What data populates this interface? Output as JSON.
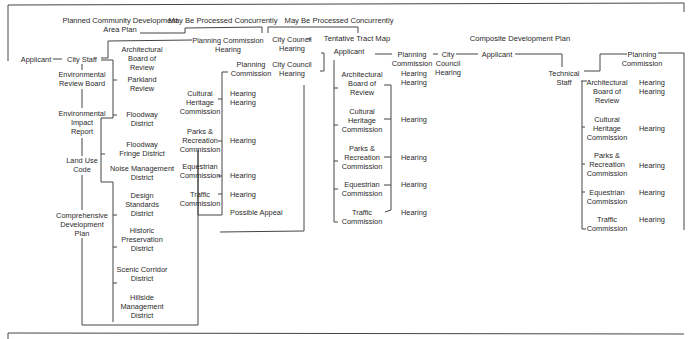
{
  "headers": {
    "pcd_area_plan": "Planned Community Development\nArea Plan",
    "concurrent_1": "May Be Processed Concurrently",
    "concurrent_2": "May Be Processed Concurrently",
    "tentative_tract_map": "Tentative Tract Map",
    "composite_plan": "Composite Development Plan"
  },
  "left_flow": {
    "applicant": "Applicant",
    "city_staff": "City Staff",
    "steps": [
      "Environmental\nReview Board",
      "Environmental\nImpact\nReport",
      "Land Use\nCode",
      "Comprehensive\nDevelopment\nPlan"
    ]
  },
  "reviews_1": [
    "Architectural\nBoard of\nReview",
    "Parkland\nReview",
    "Floodway\nDistrict",
    "Floodway\nFringe District",
    "Noise Management\nDistrict",
    "Design\nStandards\nDistrict",
    "Historic\nPreservation\nDistrict",
    "Scenic Corridor\nDistrict",
    "Hillside\nManagement\nDistrict"
  ],
  "pc_hearing": "Planning Commission\nHearing",
  "commissions_1": {
    "planning_commission": "Planning\nCommission",
    "items": [
      {
        "name": "Cultural\nHeritage\nCommission",
        "result": "Hearing\nHearing"
      },
      {
        "name": "Parks &\nRecreation\nCommission",
        "result": "Hearing"
      },
      {
        "name": "Equestrian\nCommission",
        "result": "Hearing"
      },
      {
        "name": "Traffic\nCommission",
        "result": "Hearing"
      }
    ],
    "appeal": "Possible Appeal"
  },
  "city_council": {
    "hearing_1": "City Council\nHearing",
    "hearing_2": "City Council\nHearing"
  },
  "tract_map": {
    "applicant": "Applicant",
    "planning_commission": "Planning\nCommission",
    "pc_hearings": "Hearing\nHearing",
    "city_council": "City\nCouncil\nHearing",
    "items": [
      {
        "name": "Architectural\nBoard of\nReview",
        "result": ""
      },
      {
        "name": "Cultural\nHeritage\nCommission",
        "result": "Hearing"
      },
      {
        "name": "Parks &\nRecreation\nCommission",
        "result": "Hearing"
      },
      {
        "name": "Equestrian\nCommission",
        "result": "Hearing"
      },
      {
        "name": "Traffic\nCommission",
        "result": "Hearing"
      }
    ]
  },
  "composite": {
    "applicant": "Applicant",
    "technical_staff": "Technical\nStaff",
    "planning_commission": "Planning\nCommission",
    "items": [
      {
        "name": "Architectural\nBoard of\nReview",
        "result": "Hearing\nHearing"
      },
      {
        "name": "Cultural\nHeritage\nCommission",
        "result": "Hearing"
      },
      {
        "name": "Parks &\nRecreation\nCommission",
        "result": "Hearing"
      },
      {
        "name": "Equestrian\nCommission",
        "result": "Hearing"
      },
      {
        "name": "Traffic\nCommission",
        "result": "Hearing"
      }
    ]
  }
}
